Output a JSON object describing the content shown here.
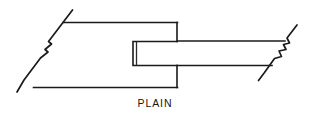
{
  "figure": {
    "name": "plain-mortise-and-tenon-joint-diagram",
    "caption": "PLAIN",
    "caption_position": {
      "x": 155,
      "y": 107
    },
    "line_color": "#1a1a1a",
    "background_color": "#ffffff",
    "width": 312,
    "height": 123,
    "parts": {
      "left_member": {
        "label": "mortised-member",
        "top_edge": "M 63.5 22.5 L 177.5 22.5",
        "bottom_edge": "M 33.5 87.5 L 177.5 87.5",
        "right_edge_upper": "M 177.0 22.5 L 177.0 41.5",
        "right_edge_lower": "M 177.0 65.5 L 177.0 87.5"
      },
      "mortise_cavity": {
        "label": "mortise-slot",
        "outline": "M 177.0 41.5 L 133.0 41.5 L 133.0 65.5 L 177.0 65.5",
        "depth_line": "M 136.5 42.5 L 136.5 64.5"
      },
      "right_member": {
        "label": "tenon-member",
        "top_edge": "M 177.5 41.0 L 285.0 41.0",
        "bottom_edge": "M 177.5 65.5 L 272.0 65.5"
      },
      "break_line_left": {
        "label": "break-line-left",
        "path": "M 72.5 10.0 L 55.0 33.0 L 48.5 41.5 L 51.5 44.0 L 45.0 49.5 L 48.0 52.0 L 40.5 58.0 L 24.0 80.0 L 17.0 92.0"
      },
      "break_line_right": {
        "label": "break-line-right",
        "path": "M 297.0 25.0 L 287.0 38.0 L 289.5 43.0 L 283.5 44.5 L 286.0 49.5 L 279.0 51.0 L 281.5 56.5 L 274.5 58.5 L 264.5 72.5 L 258.5 80.5"
      }
    }
  }
}
